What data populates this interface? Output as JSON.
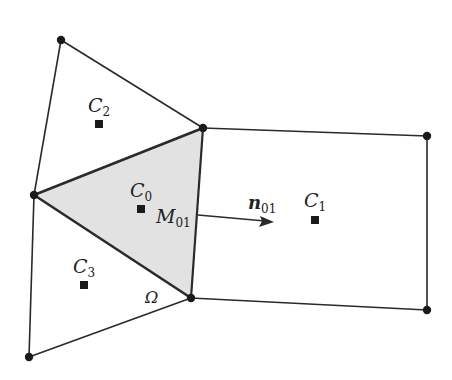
{
  "diagram": {
    "colors": {
      "line": "#2a2a2a",
      "shaded_cell": "#e2e2e2",
      "background": "#ffffff"
    },
    "vertices": {
      "top": [
        61,
        40
      ],
      "left": [
        34,
        195
      ],
      "tri_top": [
        203,
        128
      ],
      "tri_bottom": [
        191,
        298
      ],
      "bottom_left": [
        29,
        357
      ],
      "rect_top_right": [
        427,
        136
      ],
      "rect_bottom_right": [
        427,
        310
      ]
    },
    "labels": {
      "c0": {
        "base": "C",
        "sub": "0"
      },
      "c1": {
        "base": "C",
        "sub": "1"
      },
      "c2": {
        "base": "C",
        "sub": "2"
      },
      "c3": {
        "base": "C",
        "sub": "3"
      },
      "m01": {
        "base": "M",
        "sub": "01"
      },
      "n01": {
        "base": "n",
        "sub": "01"
      },
      "omega": "Ω"
    }
  }
}
